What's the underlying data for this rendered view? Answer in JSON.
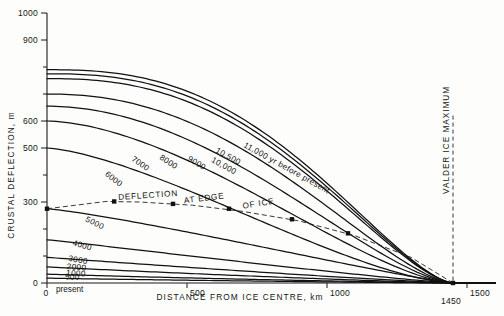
{
  "chart_data": {
    "type": "line",
    "title": "",
    "xlabel": "DISTANCE FROM ICE CENTRE, km",
    "ylabel": "CRUSTAL DEFLECTION, m",
    "xlim": [
      0,
      1600
    ],
    "ylim": [
      0,
      1000
    ],
    "grid": false,
    "legend_position": "inline-curve-labels",
    "x_ticks": [
      {
        "value": 0,
        "label": "0"
      },
      {
        "value": 500,
        "label": "500"
      },
      {
        "value": 1000,
        "label": "1000"
      },
      {
        "value": 1500,
        "label": "1500"
      }
    ],
    "x_extra_ticks": [
      {
        "value": 1450,
        "label": "1450"
      }
    ],
    "x_origin_note": "present",
    "y_ticks": [
      {
        "value": 0,
        "label": "0"
      },
      {
        "value": 100,
        "label": ""
      },
      {
        "value": 200,
        "label": ""
      },
      {
        "value": 300,
        "label": "300"
      },
      {
        "value": 400,
        "label": ""
      },
      {
        "value": 500,
        "label": "500"
      },
      {
        "value": 600,
        "label": "600"
      },
      {
        "value": 700,
        "label": ""
      },
      {
        "value": 800,
        "label": ""
      },
      {
        "value": 900,
        "label": "900"
      },
      {
        "value": 1000,
        "label": "1000"
      }
    ],
    "series": [
      {
        "name": "11,000 yr before present",
        "label": "11,000 yr before present",
        "y0": 790,
        "x_end": 1450,
        "shape": 2.55,
        "label_x": 700,
        "label_y": 505,
        "label_rot": 29
      },
      {
        "name": "10,500",
        "label": "10,500",
        "y0": 775,
        "x_end": 1450,
        "shape": 2.5,
        "label_x": 600,
        "label_y": 485,
        "label_rot": 29
      },
      {
        "name": "10,000",
        "label": "10,000",
        "y0": 757,
        "x_end": 1450,
        "shape": 2.45,
        "label_x": 585,
        "label_y": 450,
        "label_rot": 29
      },
      {
        "name": "9000",
        "label": "9000",
        "y0": 700,
        "x_end": 1450,
        "shape": 2.2,
        "label_x": 500,
        "label_y": 455,
        "label_rot": 31
      },
      {
        "name": "8000",
        "label": "8000",
        "y0": 655,
        "x_end": 1450,
        "shape": 1.95,
        "label_x": 400,
        "label_y": 460,
        "label_rot": 33
      },
      {
        "name": "7000",
        "label": "7000",
        "y0": 600,
        "x_end": 1450,
        "shape": 1.7,
        "label_x": 300,
        "label_y": 455,
        "label_rot": 35
      },
      {
        "name": "6000",
        "label": "6000",
        "y0": 500,
        "x_end": 1450,
        "shape": 1.45,
        "label_x": 205,
        "label_y": 400,
        "label_rot": 38
      },
      {
        "name": "5000",
        "label": "5000",
        "y0": 275,
        "x_end": 1450,
        "shape": 1.2,
        "label_x": 135,
        "label_y": 230,
        "label_rot": 27
      },
      {
        "name": "4000",
        "label": "4000",
        "y0": 160,
        "x_end": 1450,
        "shape": 1.05,
        "label_x": 90,
        "label_y": 140,
        "label_rot": 16
      },
      {
        "name": "3000",
        "label": "3000",
        "y0": 95,
        "x_end": 1450,
        "shape": 1.0,
        "label_x": 75,
        "label_y": 82,
        "label_rot": 9
      },
      {
        "name": "2000",
        "label": "2000",
        "y0": 60,
        "x_end": 1450,
        "shape": 0.95,
        "label_x": 70,
        "label_y": 52,
        "label_rot": 5
      },
      {
        "name": "1000",
        "label": "1000",
        "y0": 33,
        "x_end": 1450,
        "shape": 0.9,
        "label_x": 68,
        "label_y": 28,
        "label_rot": 3
      },
      {
        "name": "500",
        "label": "500",
        "y0": 18,
        "x_end": 1450,
        "shape": 0.9,
        "label_x": 64,
        "label_y": 14,
        "label_rot": 2
      }
    ],
    "deflection_envelope": {
      "label_words": [
        "DEFLECTION",
        "AT EDGE",
        "OF ICE"
      ],
      "style": "dashed",
      "points": [
        {
          "x": 0,
          "y": 275
        },
        {
          "x": 210,
          "y": 302
        },
        {
          "x": 330,
          "y": 300
        },
        {
          "x": 520,
          "y": 288
        },
        {
          "x": 700,
          "y": 265
        },
        {
          "x": 900,
          "y": 230
        },
        {
          "x": 1100,
          "y": 175
        },
        {
          "x": 1300,
          "y": 95
        },
        {
          "x": 1450,
          "y": 0
        }
      ],
      "markers": [
        {
          "x": 0,
          "y": 275
        },
        {
          "x": 240,
          "y": 302
        },
        {
          "x": 450,
          "y": 293
        },
        {
          "x": 650,
          "y": 275
        },
        {
          "x": 875,
          "y": 236
        },
        {
          "x": 1075,
          "y": 184
        },
        {
          "x": 1450,
          "y": 0
        }
      ]
    },
    "vertical_marker": {
      "label": "VALDER ICE MAXIMUM",
      "x": 1450,
      "style": "dashed"
    },
    "annotations": [
      {
        "text": "present",
        "x": 0,
        "y": 0,
        "placement": "below-axis-origin"
      }
    ]
  },
  "caption": {
    "partial_text": ""
  }
}
